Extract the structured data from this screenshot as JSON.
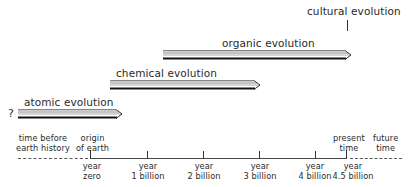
{
  "stages": [
    {
      "label": "atomic evolution",
      "start_x": 18,
      "end_x": 121,
      "y": 110,
      "label_x": 24,
      "label_y": 97
    },
    {
      "label": "chemical evolution",
      "start_x": 110,
      "end_x": 258,
      "y": 81,
      "label_x": 116,
      "label_y": 68
    },
    {
      "label": "organic evolution",
      "start_x": 163,
      "end_x": 350,
      "y": 51,
      "label_x": 222,
      "label_y": 38
    }
  ],
  "cultural": {
    "label": "cultural evolution"
  },
  "unknown_start": "?",
  "regions": {
    "before": [
      "time before",
      "earth history"
    ],
    "origin": [
      "origin",
      "of earth"
    ],
    "present": [
      "present",
      "time"
    ],
    "future": [
      "future",
      "time"
    ]
  },
  "timeline": {
    "ticks": [
      {
        "line1": "year",
        "line2": "zero",
        "x": 90
      },
      {
        "line1": "year",
        "line2": "1 billion",
        "x": 147
      },
      {
        "line1": "year",
        "line2": "2 billion",
        "x": 203
      },
      {
        "line1": "year",
        "line2": "3 billion",
        "x": 259
      },
      {
        "line1": "year",
        "line2": "4 billion",
        "x": 315
      },
      {
        "line1": "year",
        "line2": "4.5 billion",
        "x": 346
      }
    ]
  }
}
